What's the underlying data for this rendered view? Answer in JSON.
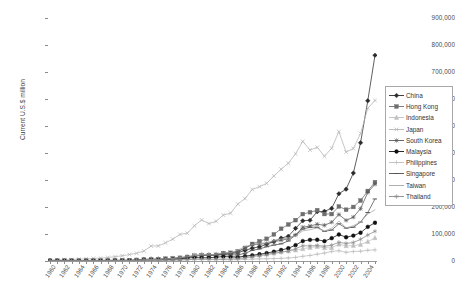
{
  "chart": {
    "y_axis_title": "Current U.S.$ million",
    "x_axis_title": "",
    "title": "",
    "y_ticks": [
      "0",
      "100,000",
      "200,000",
      "300,000",
      "400,000",
      "500,000",
      "600,000",
      "700,000",
      "800,000",
      "900,000"
    ]
  },
  "legend": {
    "position": "right",
    "items": [
      {
        "label": "China",
        "marker": "diamond",
        "color": "#2b2b2b"
      },
      {
        "label": "Hong Kong",
        "marker": "square",
        "color": "#6e6e6e"
      },
      {
        "label": "Indonesia",
        "marker": "triangle",
        "color": "#c0c0c0"
      },
      {
        "label": "Japan",
        "marker": "x",
        "color": "#b4b4b4"
      },
      {
        "label": "South Korea",
        "marker": "asterisk",
        "color": "#585858"
      },
      {
        "label": "Malaysia",
        "marker": "circle",
        "color": "#111111"
      },
      {
        "label": "Philippines",
        "marker": "plus",
        "color": "#bdbdbd"
      },
      {
        "label": "Singapore",
        "marker": "dash",
        "color": "#4f4f4f"
      },
      {
        "label": "Taiwan",
        "marker": "line",
        "color": "#a5a5a5"
      },
      {
        "label": "Thailand",
        "marker": "star",
        "color": "#8a8a8a"
      }
    ]
  },
  "chart_data": {
    "type": "line",
    "title": "",
    "xlabel": "",
    "ylabel": "Current U.S.$ million",
    "ylim": [
      0,
      900000
    ],
    "xlim": [
      1960,
      2005
    ],
    "grid": true,
    "legend_position": "right",
    "y_tick_values": [
      0,
      100000,
      200000,
      300000,
      400000,
      500000,
      600000,
      700000,
      800000,
      900000
    ],
    "x_tick_labels": [
      "1960",
      "1962",
      "1964",
      "1966",
      "1968",
      "1970",
      "1972",
      "1974",
      "1976",
      "1978",
      "1980",
      "1982",
      "1984",
      "1986",
      "1988",
      "1990",
      "1992",
      "1994",
      "1996",
      "1998",
      "2000",
      "2002",
      "2004"
    ],
    "x": [
      1960,
      1961,
      1962,
      1963,
      1964,
      1965,
      1966,
      1967,
      1968,
      1969,
      1970,
      1971,
      1972,
      1973,
      1974,
      1975,
      1976,
      1977,
      1978,
      1979,
      1980,
      1981,
      1982,
      1983,
      1984,
      1985,
      1986,
      1987,
      1988,
      1989,
      1990,
      1991,
      1992,
      1993,
      1994,
      1995,
      1996,
      1997,
      1998,
      1999,
      2000,
      2001,
      2002,
      2003,
      2004,
      2005
    ],
    "series": [
      {
        "name": "China",
        "marker": "diamond",
        "color": "#2b2b2b",
        "values": [
          1900,
          1600,
          1500,
          1600,
          1900,
          2200,
          2400,
          2100,
          2100,
          2200,
          2300,
          2600,
          3400,
          5800,
          7000,
          7300,
          6900,
          7600,
          9800,
          13700,
          18100,
          22000,
          22300,
          22200,
          26100,
          27400,
          30900,
          39400,
          47500,
          52500,
          62100,
          71800,
          84900,
          91700,
          121000,
          148800,
          151000,
          182800,
          183800,
          194900,
          249200,
          266100,
          325600,
          438200,
          593300,
          762000
        ]
      },
      {
        "name": "Hong Kong",
        "marker": "square",
        "color": "#6e6e6e",
        "values": [
          1000,
          1200,
          1300,
          1400,
          1600,
          1900,
          2000,
          2200,
          2500,
          2900,
          3000,
          3400,
          3900,
          5100,
          5900,
          6000,
          8500,
          9600,
          11500,
          15100,
          19700,
          21800,
          21000,
          21900,
          28300,
          30200,
          35400,
          48500,
          63200,
          73100,
          82200,
          98600,
          119500,
          135200,
          151400,
          173800,
          180700,
          188200,
          174000,
          173900,
          201900,
          189900,
          200100,
          223800,
          259300,
          292100
        ]
      },
      {
        "name": "Indonesia",
        "marker": "triangle",
        "color": "#c0c0c0",
        "values": [
          840,
          790,
          680,
          700,
          680,
          710,
          780,
          820,
          870,
          1000,
          1100,
          1230,
          1780,
          3210,
          7420,
          7100,
          8560,
          10850,
          11640,
          15580,
          21910,
          25160,
          22330,
          21150,
          21890,
          18590,
          14800,
          17140,
          19220,
          22160,
          25680,
          29140,
          33970,
          36820,
          40050,
          45420,
          49810,
          53440,
          48850,
          48670,
          62120,
          56300,
          57160,
          61060,
          71580,
          85660
        ]
      },
      {
        "name": "Japan",
        "marker": "x",
        "color": "#b4b4b4",
        "values": [
          4100,
          4200,
          4900,
          5400,
          6700,
          8500,
          9800,
          10400,
          13000,
          16000,
          19300,
          24000,
          28600,
          37000,
          55500,
          55800,
          67300,
          81100,
          98400,
          103000,
          130400,
          152000,
          138400,
          146900,
          170100,
          177200,
          210800,
          231300,
          264900,
          275200,
          287600,
          314900,
          339900,
          362200,
          397000,
          443100,
          411000,
          421000,
          387900,
          417600,
          479200,
          403500,
          416700,
          471800,
          565700,
          594900
        ]
      },
      {
        "name": "South Korea",
        "marker": "asterisk",
        "color": "#585858",
        "values": [
          33,
          41,
          55,
          87,
          119,
          175,
          250,
          320,
          455,
          623,
          835,
          1068,
          1624,
          3225,
          4460,
          5081,
          7715,
          10046,
          12711,
          15055,
          17505,
          21254,
          21853,
          24445,
          29245,
          30283,
          34715,
          47281,
          60696,
          62377,
          65016,
          71870,
          76632,
          82236,
          96013,
          125058,
          129715,
          136164,
          132313,
          143685,
          172268,
          150439,
          162471,
          193817,
          253845,
          284419
        ]
      },
      {
        "name": "Malaysia",
        "marker": "circle",
        "color": "#111111",
        "values": [
          1100,
          1000,
          1050,
          1100,
          1150,
          1250,
          1300,
          1310,
          1390,
          1700,
          1690,
          1640,
          1720,
          2930,
          4230,
          3840,
          5300,
          6070,
          7410,
          11080,
          12960,
          11770,
          12030,
          14110,
          16490,
          15410,
          13870,
          17990,
          21200,
          25050,
          29450,
          34350,
          40710,
          47130,
          58760,
          73900,
          78330,
          78740,
          73300,
          84500,
          98230,
          88000,
          94000,
          104700,
          126500,
          141600
        ]
      },
      {
        "name": "Philippines",
        "marker": "plus",
        "color": "#bdbdbd",
        "values": [
          560,
          500,
          560,
          730,
          740,
          770,
          830,
          830,
          840,
          850,
          1060,
          1140,
          1110,
          1890,
          2730,
          2290,
          2570,
          3150,
          3430,
          4600,
          5790,
          5720,
          5020,
          5000,
          5390,
          4630,
          4840,
          5720,
          7070,
          7820,
          8190,
          8840,
          9820,
          11380,
          13480,
          17450,
          20540,
          25230,
          29500,
          35040,
          38080,
          32150,
          35210,
          36230,
          39680,
          41300
        ]
      },
      {
        "name": "Singapore",
        "marker": "dash",
        "color": "#4f4f4f",
        "values": [
          1130,
          1120,
          1140,
          1150,
          1000,
          980,
          1100,
          1190,
          1350,
          1720,
          1550,
          1760,
          2190,
          3630,
          5790,
          5380,
          6590,
          8240,
          10130,
          14240,
          19380,
          20970,
          20790,
          21830,
          24070,
          22810,
          22500,
          28690,
          39310,
          44660,
          52750,
          59030,
          63470,
          74010,
          96830,
          118260,
          125010,
          124990,
          109900,
          114680,
          137800,
          121750,
          125200,
          144200,
          179600,
          229700
        ]
      },
      {
        "name": "Taiwan",
        "marker": "line",
        "color": "#a5a5a5",
        "values": [
          170,
          200,
          220,
          330,
          430,
          450,
          540,
          640,
          790,
          1050,
          1430,
          2060,
          2990,
          4480,
          5640,
          5310,
          8170,
          9360,
          12690,
          16110,
          19810,
          22610,
          22200,
          25120,
          30460,
          30720,
          39860,
          53680,
          60670,
          66300,
          67210,
          76180,
          81470,
          85090,
          93050,
          111660,
          115940,
          122080,
          110580,
          121590,
          148320,
          122870,
          130600,
          144200,
          174000,
          189400
        ]
      },
      {
        "name": "Thailand",
        "marker": "star",
        "color": "#8a8a8a",
        "values": [
          410,
          470,
          470,
          470,
          590,
          640,
          700,
          680,
          670,
          710,
          710,
          840,
          1080,
          1560,
          2440,
          2180,
          2980,
          3490,
          4050,
          5290,
          6510,
          7030,
          6940,
          6370,
          7410,
          7120,
          8850,
          11600,
          15900,
          20060,
          23070,
          28420,
          32470,
          36970,
          45260,
          56460,
          55780,
          57640,
          54460,
          58500,
          69060,
          65100,
          68250,
          80300,
          96200,
          110100
        ]
      }
    ]
  }
}
